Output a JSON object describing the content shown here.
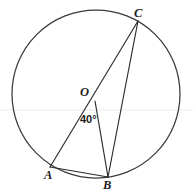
{
  "figure": {
    "kind": "circle-geometry-diagram",
    "background_color": "#ffffff",
    "stroke_color": "#2b2b2b",
    "width": 193,
    "height": 196
  },
  "circle": {
    "name": "main-circle",
    "center_x": 96,
    "center_y": 94,
    "radius": 84,
    "stroke_color": "#3a3a3a"
  },
  "points": {
    "O": {
      "label": "O",
      "x": 95,
      "y": 101,
      "label_x": 80,
      "label_y": 86,
      "role": "center"
    },
    "A": {
      "label": "A",
      "x": 50,
      "y": 167,
      "label_x": 44,
      "label_y": 169,
      "role": "on-circle"
    },
    "B": {
      "label": "B",
      "x": 108,
      "y": 177,
      "label_x": 103,
      "label_y": 179,
      "role": "on-circle"
    },
    "C": {
      "label": "C",
      "x": 138,
      "y": 21,
      "label_x": 134,
      "label_y": 7,
      "role": "on-circle"
    }
  },
  "segments": [
    {
      "name": "segment-A-C",
      "from": "A",
      "to": "C",
      "through": "O",
      "x1": 50,
      "y1": 167,
      "x2": 138,
      "y2": 21
    },
    {
      "name": "segment-O-B",
      "from": "O",
      "to": "B",
      "x1": 95,
      "y1": 101,
      "x2": 108,
      "y2": 177
    },
    {
      "name": "segment-C-B",
      "from": "C",
      "to": "B",
      "x1": 138,
      "y1": 21,
      "x2": 108,
      "y2": 177
    },
    {
      "name": "segment-A-B",
      "from": "A",
      "to": "B",
      "x1": 50,
      "y1": 167,
      "x2": 108,
      "y2": 177
    }
  ],
  "angles": [
    {
      "name": "angle-AOB",
      "text": "40°",
      "value": 40,
      "unit": "degrees",
      "vertex": "O",
      "rays": [
        "A",
        "B"
      ],
      "label_x": 80,
      "label_y": 114
    }
  ],
  "artifacts": {
    "scan_line_y": 110,
    "scan_line_color": "#e9e9ea"
  }
}
